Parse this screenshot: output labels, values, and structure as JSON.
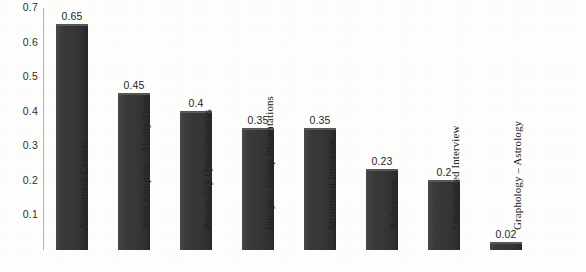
{
  "chart_data": {
    "type": "bar",
    "title": "",
    "subtitle": "",
    "xlabel": "",
    "ylabel": "",
    "ylim": [
      0,
      0.7
    ],
    "grid": false,
    "legend": false,
    "y_ticks": [
      "0.1",
      "0.2",
      "0.3",
      "0.4",
      "0.5",
      "0.6",
      "0.7"
    ],
    "y_tick_values": [
      0.1,
      0.2,
      0.3,
      0.4,
      0.5,
      0.6,
      0.7
    ],
    "bar_color": "#3c3c3c",
    "axis_color": "#b4b4b4",
    "background_color": "#fdfdfc",
    "categories": [
      "Assessment Centres",
      "Work Samples – Ability Tests",
      "Personality Questionnaires",
      "Intrays – Group Presentations",
      "Structured Interview",
      "References",
      "Unstructured Interview",
      "Graphology – Astrology"
    ],
    "values": [
      0.65,
      0.45,
      0.4,
      0.35,
      0.35,
      0.23,
      0.2,
      0.02
    ],
    "value_labels": [
      "0.65",
      "0.45",
      "0.4",
      "0.35",
      "0.35",
      "0.23",
      "0.2",
      "0.02"
    ]
  }
}
